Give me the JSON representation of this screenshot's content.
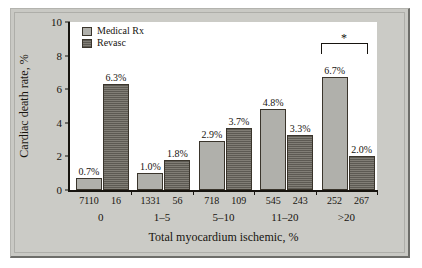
{
  "chart_data": {
    "type": "bar",
    "title": "",
    "xlabel": "Total myocardium ischemic, %",
    "ylabel": "Cardiac death rate, %",
    "ylim": [
      0,
      10
    ],
    "yticks": [
      0,
      2,
      4,
      6,
      8,
      10
    ],
    "ytick_labels": [
      "0",
      "2",
      "4",
      "6",
      "8",
      "10"
    ],
    "grid": false,
    "legend_position": "top-left",
    "categories": [
      "0",
      "1–5",
      "5–10",
      "11–20",
      ">20"
    ],
    "series": [
      {
        "name": "Medical Rx",
        "color": "#b0b0ab",
        "values": [
          0.7,
          1.0,
          2.9,
          4.8,
          6.7
        ],
        "value_labels": [
          "0.7%",
          "1.0%",
          "2.9%",
          "4.8%",
          "6.7%"
        ],
        "n": [
          "7110",
          "1331",
          "718",
          "545",
          "252"
        ]
      },
      {
        "name": "Revasc",
        "color": "#5d5a53",
        "values": [
          6.3,
          1.8,
          3.7,
          3.3,
          2.0
        ],
        "value_labels": [
          "6.3%",
          "1.8%",
          "3.7%",
          "3.3%",
          "2.0%"
        ],
        "n": [
          "16",
          "56",
          "109",
          "243",
          "267"
        ]
      }
    ],
    "annotations": [
      {
        "type": "significance-bracket",
        "label": "*",
        "category": ">20"
      }
    ]
  },
  "legend": {
    "items": [
      {
        "label": "Medical Rx"
      },
      {
        "label": "Revasc"
      }
    ]
  }
}
